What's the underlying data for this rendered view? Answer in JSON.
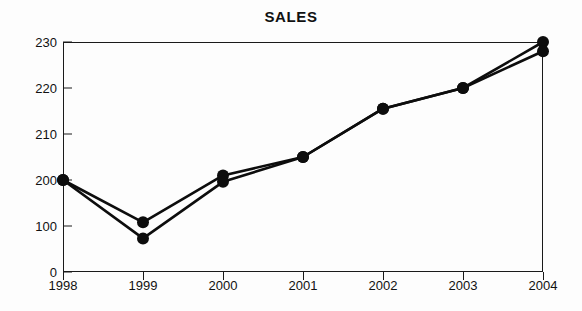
{
  "chart_data": {
    "type": "line",
    "title": "SALES",
    "xlabel": "",
    "ylabel": "",
    "grid": false,
    "legend": "none",
    "x": [
      "1998",
      "1999",
      "2000",
      "2001",
      "2002",
      "2003",
      "2004"
    ],
    "categories": [
      "1998",
      "1999",
      "2000",
      "2001",
      "2002",
      "2003",
      "2004"
    ],
    "y_tick_labels": [
      "0",
      "100",
      "200",
      "210",
      "220",
      "230"
    ],
    "y_tick_values": [
      0,
      100,
      200,
      210,
      220,
      230
    ],
    "y_axis_note": "broken scale: ticks evenly spaced although intervals differ",
    "ylim": [
      0,
      230
    ],
    "series": [
      {
        "name": "Series 1",
        "values": [
          200,
          108,
          201,
          205,
          215.5,
          220,
          230
        ]
      },
      {
        "name": "Series 2",
        "values": [
          200,
          73,
          196,
          205,
          215.5,
          220,
          228
        ]
      }
    ],
    "colors": {
      "line": "#0d0d0d",
      "marker": "#0d0d0d",
      "axis": "#1a1a1a",
      "background": "#fdfdfd",
      "text": "#111111"
    }
  }
}
